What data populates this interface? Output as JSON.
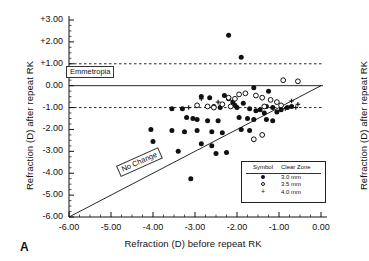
{
  "figure": {
    "panel_letter": "A",
    "xlabel": "Refraction (D) before repeat RK",
    "ylabel_left": "Refraction (D) after repeat RK",
    "ylabel_right": "Refraction (D) after repeat RK"
  },
  "annotations": {
    "emmetropia": "Emmetropia",
    "no_change": "No Change"
  },
  "legend": {
    "header_symbol": "Symbol",
    "header_clear_zone": "Clear Zone",
    "rows": [
      {
        "glyph": "filled-circle-icon",
        "value": "3.0  mm"
      },
      {
        "glyph": "open-circle-icon",
        "value": "3.5  mm"
      },
      {
        "glyph": "plus-icon",
        "value": "4.0  mm"
      }
    ]
  },
  "chart_data": {
    "type": "scatter",
    "title": "",
    "xlabel": "Refraction (D) before repeat RK",
    "ylabel": "Refraction (D) after repeat RK",
    "xlim": [
      -6.0,
      0.0
    ],
    "ylim": [
      -6.0,
      3.0
    ],
    "xticks": [
      "-6.00",
      "-5.00",
      "-4.00",
      "-3.00",
      "-2.00",
      "-1.00",
      "0.00"
    ],
    "xtick_values": [
      -6,
      -5,
      -4,
      -3,
      -2,
      -1,
      0
    ],
    "yticks": [
      "+3.00",
      "+2.00",
      "+1.00",
      "0.00",
      "-1.00",
      "-2.00",
      "-3.00",
      "-4.00",
      "-5.00",
      "-6.00"
    ],
    "ytick_values": [
      3,
      2,
      1,
      0,
      -1,
      -2,
      -3,
      -4,
      -5,
      -6
    ],
    "grid": false,
    "legend_position": "lower-right",
    "reference_lines": [
      {
        "name": "emmetropia",
        "type": "horizontal",
        "y": 0.0,
        "style": "solid",
        "label": "Emmetropia"
      },
      {
        "name": "plus-one-diopter",
        "type": "horizontal",
        "y": 1.0,
        "style": "dashed",
        "label": ""
      },
      {
        "name": "minus-one-diopter",
        "type": "horizontal",
        "y": -1.0,
        "style": "dashed",
        "label": ""
      },
      {
        "name": "no-change",
        "type": "identity",
        "slope": 1,
        "intercept": 0,
        "style": "solid",
        "label": "No Change"
      }
    ],
    "series": [
      {
        "name": "3.0 mm clear zone",
        "marker": "filled-circle",
        "points": [
          [
            -2.2,
            2.3
          ],
          [
            -1.9,
            1.3
          ],
          [
            -1.6,
            -0.1
          ],
          [
            -1.25,
            -0.25
          ],
          [
            -4.05,
            -2.0
          ],
          [
            -3.55,
            -2.05
          ],
          [
            -3.25,
            -2.1
          ],
          [
            -4.0,
            -2.55
          ],
          [
            -3.95,
            -3.1
          ],
          [
            -3.4,
            -3.0
          ],
          [
            -3.1,
            -4.25
          ],
          [
            -3.55,
            -1.05
          ],
          [
            -3.3,
            -1.05
          ],
          [
            -2.85,
            -0.5
          ],
          [
            -2.65,
            -0.55
          ],
          [
            -2.3,
            -0.45
          ],
          [
            -2.05,
            -0.9
          ],
          [
            -2.0,
            -1.0
          ],
          [
            -2.95,
            -1.55
          ],
          [
            -2.7,
            -1.6
          ],
          [
            -2.45,
            -1.6
          ],
          [
            -2.95,
            -2.05
          ],
          [
            -2.6,
            -2.1
          ],
          [
            -2.35,
            -2.15
          ],
          [
            -2.85,
            -2.65
          ],
          [
            -2.6,
            -2.75
          ],
          [
            -2.2,
            -0.6
          ],
          [
            -2.1,
            -0.75
          ],
          [
            -1.85,
            -0.8
          ],
          [
            -1.7,
            -1.05
          ],
          [
            -1.55,
            -1.15
          ],
          [
            -1.95,
            -1.45
          ],
          [
            -1.75,
            -1.5
          ],
          [
            -1.6,
            -1.55
          ],
          [
            -1.9,
            -2.0
          ],
          [
            -1.7,
            -2.05
          ],
          [
            -1.45,
            -1.1
          ],
          [
            -1.35,
            -1.25
          ],
          [
            -1.3,
            -0.95
          ],
          [
            -1.15,
            -1.0
          ],
          [
            -1.05,
            -1.2
          ],
          [
            -0.95,
            -1.1
          ],
          [
            -2.5,
            -3.1
          ],
          [
            -2.25,
            -3.05
          ],
          [
            -1.3,
            -1.55
          ],
          [
            -1.15,
            -1.6
          ],
          [
            -2.55,
            -0.95
          ],
          [
            -2.4,
            -1.0
          ],
          [
            -3.2,
            -1.45
          ],
          [
            -3.05,
            -1.5
          ],
          [
            -0.8,
            -1.0
          ],
          [
            -0.7,
            -0.95
          ]
        ]
      },
      {
        "name": "3.5 mm clear zone",
        "marker": "open-circle",
        "points": [
          [
            -0.9,
            0.25
          ],
          [
            -0.55,
            0.2
          ],
          [
            -1.95,
            -0.4
          ],
          [
            -1.8,
            -0.35
          ],
          [
            -1.55,
            -0.45
          ],
          [
            -1.4,
            -0.55
          ],
          [
            -2.2,
            -0.55
          ],
          [
            -2.05,
            -0.6
          ],
          [
            -1.2,
            -0.65
          ],
          [
            -1.05,
            -0.75
          ],
          [
            -2.35,
            -0.85
          ],
          [
            -2.15,
            -0.95
          ],
          [
            -1.35,
            -0.95
          ],
          [
            -0.95,
            -0.9
          ],
          [
            -2.7,
            -0.95
          ],
          [
            -2.55,
            -1.0
          ],
          [
            -1.6,
            -2.45
          ],
          [
            -1.4,
            -2.25
          ],
          [
            -2.95,
            -0.9
          ]
        ]
      },
      {
        "name": "4.0 mm clear zone",
        "marker": "plus",
        "points": [
          [
            -2.85,
            -0.6
          ],
          [
            -2.45,
            -0.75
          ],
          [
            -0.85,
            -1.05
          ],
          [
            -0.6,
            -1.0
          ],
          [
            -0.7,
            -0.7
          ],
          [
            -0.55,
            -0.85
          ],
          [
            -3.15,
            -1.0
          ]
        ]
      }
    ]
  }
}
